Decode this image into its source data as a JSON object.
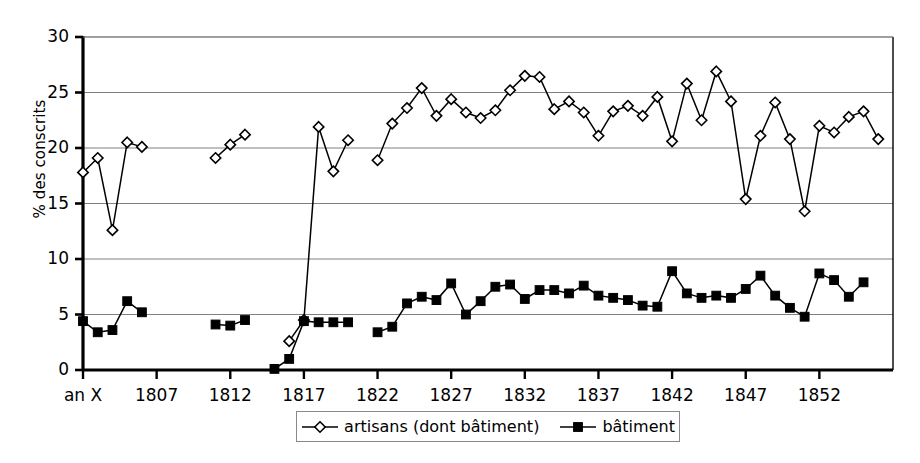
{
  "chart_data": {
    "type": "line",
    "title": "",
    "subtitle": "",
    "xlabel": "",
    "ylabel": "% des conscrits",
    "ylim": [
      0,
      30
    ],
    "ytick_values": [
      0,
      5,
      10,
      15,
      20,
      25,
      30
    ],
    "ytick_labels": [
      "0",
      "5",
      "10",
      "15",
      "20",
      "25",
      "30"
    ],
    "xlim": [
      1802,
      1857
    ],
    "xtick_values": [
      1802,
      1807,
      1812,
      1817,
      1822,
      1827,
      1832,
      1837,
      1842,
      1847,
      1852
    ],
    "xtick_labels": [
      "an X",
      "1807",
      "1812",
      "1817",
      "1822",
      "1827",
      "1832",
      "1837",
      "1842",
      "1847",
      "1852"
    ],
    "grid": "horizontal",
    "legend_position": "bottom-center",
    "series": [
      {
        "name": "artisans (dont bâtiment)",
        "marker": "open-diamond",
        "color": "#000000",
        "points": [
          [
            1802,
            17.8
          ],
          [
            1803,
            19.1
          ],
          [
            1804,
            12.6
          ],
          [
            1805,
            20.5
          ],
          [
            1806,
            20.1
          ],
          [
            1811,
            19.1
          ],
          [
            1812,
            20.3
          ],
          [
            1813,
            21.2
          ],
          [
            1816,
            2.6
          ],
          [
            1817,
            4.5
          ],
          [
            1818,
            21.9
          ],
          [
            1819,
            17.9
          ],
          [
            1820,
            20.7
          ],
          [
            1822,
            18.9
          ],
          [
            1823,
            22.2
          ],
          [
            1824,
            23.6
          ],
          [
            1825,
            25.4
          ],
          [
            1826,
            22.9
          ],
          [
            1827,
            24.4
          ],
          [
            1828,
            23.2
          ],
          [
            1829,
            22.7
          ],
          [
            1830,
            23.4
          ],
          [
            1831,
            25.2
          ],
          [
            1832,
            26.5
          ],
          [
            1833,
            26.4
          ],
          [
            1834,
            23.5
          ],
          [
            1835,
            24.2
          ],
          [
            1836,
            23.2
          ],
          [
            1837,
            21.1
          ],
          [
            1838,
            23.3
          ],
          [
            1839,
            23.8
          ],
          [
            1840,
            22.9
          ],
          [
            1841,
            24.6
          ],
          [
            1842,
            20.6
          ],
          [
            1843,
            25.8
          ],
          [
            1844,
            22.5
          ],
          [
            1845,
            26.9
          ],
          [
            1846,
            24.2
          ],
          [
            1847,
            15.4
          ],
          [
            1848,
            21.1
          ],
          [
            1849,
            24.1
          ],
          [
            1850,
            20.8
          ],
          [
            1851,
            14.3
          ],
          [
            1852,
            22.0
          ],
          [
            1853,
            21.4
          ],
          [
            1854,
            22.8
          ],
          [
            1855,
            23.3
          ],
          [
            1856,
            20.8
          ]
        ]
      },
      {
        "name": "bâtiment",
        "marker": "filled-square",
        "color": "#000000",
        "points": [
          [
            1802,
            4.4
          ],
          [
            1803,
            3.4
          ],
          [
            1804,
            3.6
          ],
          [
            1805,
            6.2
          ],
          [
            1806,
            5.2
          ],
          [
            1811,
            4.1
          ],
          [
            1812,
            4.0
          ],
          [
            1813,
            4.5
          ],
          [
            1815,
            0.1
          ],
          [
            1816,
            1.0
          ],
          [
            1817,
            4.4
          ],
          [
            1818,
            4.3
          ],
          [
            1819,
            4.3
          ],
          [
            1820,
            4.3
          ],
          [
            1822,
            3.4
          ],
          [
            1823,
            3.9
          ],
          [
            1824,
            6.0
          ],
          [
            1825,
            6.6
          ],
          [
            1826,
            6.3
          ],
          [
            1827,
            7.8
          ],
          [
            1828,
            5.0
          ],
          [
            1829,
            6.2
          ],
          [
            1830,
            7.5
          ],
          [
            1831,
            7.7
          ],
          [
            1832,
            6.4
          ],
          [
            1833,
            7.2
          ],
          [
            1834,
            7.2
          ],
          [
            1835,
            6.9
          ],
          [
            1836,
            7.6
          ],
          [
            1837,
            6.7
          ],
          [
            1838,
            6.5
          ],
          [
            1839,
            6.3
          ],
          [
            1840,
            5.8
          ],
          [
            1841,
            5.7
          ],
          [
            1842,
            8.9
          ],
          [
            1843,
            6.9
          ],
          [
            1844,
            6.5
          ],
          [
            1845,
            6.7
          ],
          [
            1846,
            6.5
          ],
          [
            1847,
            7.3
          ],
          [
            1848,
            8.5
          ],
          [
            1849,
            6.7
          ],
          [
            1850,
            5.6
          ],
          [
            1851,
            4.8
          ],
          [
            1852,
            8.7
          ],
          [
            1853,
            8.1
          ],
          [
            1854,
            6.6
          ],
          [
            1855,
            7.9
          ]
        ]
      }
    ]
  },
  "legend": {
    "items": [
      {
        "label": "artisans (dont bâtiment)",
        "marker": "open-diamond"
      },
      {
        "label": "bâtiment",
        "marker": "filled-square"
      }
    ]
  },
  "style": {
    "axis_color": "#000000",
    "grid_color": "#808080",
    "plot_background": "#ffffff",
    "series_color": "#000000"
  }
}
